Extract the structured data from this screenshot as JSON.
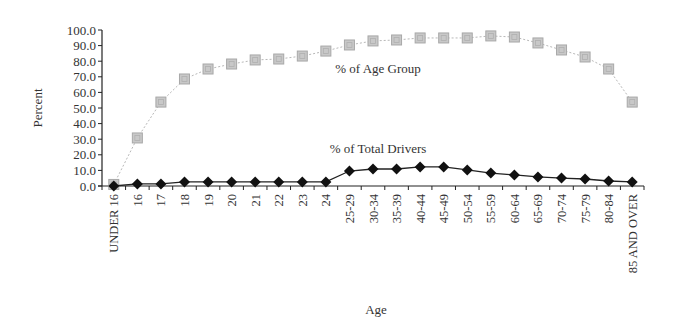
{
  "chart_data": {
    "type": "line",
    "title": "",
    "xlabel": "Age",
    "ylabel": "Percent",
    "ylim": [
      0,
      100
    ],
    "y_ticks": [
      "0.0",
      "10.0",
      "20.0",
      "30.0",
      "40.0",
      "50.0",
      "60.0",
      "70.0",
      "80.0",
      "90.0",
      "100.0"
    ],
    "grid": false,
    "legend": "inline labels",
    "categories": [
      "UNDER 16",
      "16",
      "17",
      "18",
      "19",
      "20",
      "21",
      "22",
      "23",
      "24",
      "25-29",
      "30-34",
      "35-39",
      "40-44",
      "45-49",
      "50-54",
      "55-59",
      "60-64",
      "65-69",
      "70-74",
      "75-79",
      "80-84",
      "85 AND OVER"
    ],
    "series": [
      {
        "name": "% of Age Group",
        "marker": "square",
        "color": "#bbbbbb",
        "values": [
          1.0,
          30.8,
          53.8,
          68.6,
          75.0,
          78.2,
          80.8,
          81.4,
          83.3,
          86.5,
          90.4,
          93.0,
          93.6,
          94.9,
          94.9,
          94.9,
          96.2,
          95.5,
          91.7,
          87.2,
          82.7,
          75.0,
          53.8
        ],
        "label_position": {
          "x": 378,
          "y": 73
        }
      },
      {
        "name": "% of Total Drivers",
        "marker": "diamond",
        "color": "#111111",
        "values": [
          0.0,
          1.3,
          1.3,
          2.6,
          2.6,
          2.6,
          2.6,
          2.6,
          2.6,
          2.6,
          9.6,
          10.9,
          10.9,
          12.2,
          12.2,
          10.3,
          8.3,
          7.1,
          5.8,
          5.1,
          4.5,
          3.2,
          2.6
        ],
        "label_position": {
          "x": 378,
          "y": 153
        }
      }
    ]
  }
}
